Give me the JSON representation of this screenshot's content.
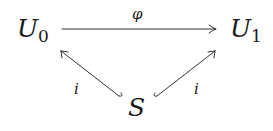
{
  "diagram": {
    "type": "commutative-diagram",
    "nodes": {
      "u0": {
        "main": "U",
        "sub": "0"
      },
      "u1": {
        "main": "U",
        "sub": "1"
      },
      "s": {
        "main": "S"
      }
    },
    "arrows": [
      {
        "from": "U0",
        "to": "U1",
        "label": "φ",
        "style": "to"
      },
      {
        "from": "S",
        "to": "U0",
        "label": "i",
        "style": "hook (inclusion)"
      },
      {
        "from": "S",
        "to": "U1",
        "label": "i",
        "style": "hook (inclusion)"
      }
    ],
    "labels": {
      "top": "φ",
      "left": "i",
      "right": "i"
    },
    "stroke_color": "#333333"
  }
}
